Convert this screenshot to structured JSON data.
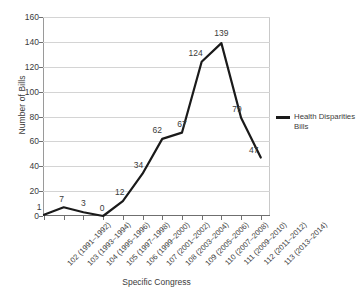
{
  "chart_data": {
    "type": "line",
    "title": "",
    "xlabel": "Specific Congress",
    "ylabel": "Number of Bills",
    "ylim": [
      0,
      160
    ],
    "ytick_step": 20,
    "yticks": [
      160,
      140,
      120,
      100,
      80,
      60,
      40,
      20,
      0
    ],
    "grid": true,
    "legend_position": "right",
    "line_color": "#1a1a1a",
    "grid_color": "#d4d4d4",
    "categories": [
      "102 (1991–1992)",
      "103 (1993–1994)",
      "104 (1995–1996)",
      "105 (1997–1998)",
      "106 (1999–2000)",
      "107 (2001–2002)",
      "108 (2003–2004)",
      "109 (2005–2006)",
      "110 (2007–2008)",
      "111 (2009–2010)",
      "112 (2011–2012)",
      "113 (2013–2014)"
    ],
    "series": [
      {
        "name": "Health Disparities Bills",
        "values": [
          1,
          7,
          3,
          0,
          12,
          34,
          62,
          67,
          124,
          139,
          79,
          47
        ]
      }
    ],
    "point_labels": [
      "1",
      "7",
      "3",
      "0",
      "12",
      "34",
      "62",
      "67",
      "124",
      "139",
      "79",
      "47"
    ]
  },
  "legend": {
    "entries": [
      {
        "label": "Health Disparities Bills"
      }
    ]
  }
}
